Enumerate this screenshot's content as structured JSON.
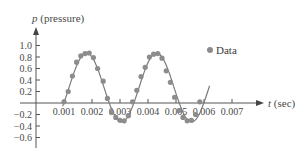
{
  "chart_data": {
    "type": "scatter",
    "title": "",
    "xlabel": "t (sec)",
    "xlabel_var": "t",
    "xlabel_unit": " (sec)",
    "ylabel": "p (pressure)",
    "ylabel_var": "p",
    "ylabel_unit": " (pressure)",
    "xlim": [
      0,
      0.0075
    ],
    "ylim": [
      -0.7,
      1.1
    ],
    "grid": false,
    "legend_position": "upper right",
    "x_ticks": [
      0.001,
      0.002,
      0.003,
      0.004,
      0.005,
      0.006,
      0.007
    ],
    "x_tick_labels": [
      "0.001",
      "0.002",
      "0.003",
      "0.004",
      "0.005",
      "0.006",
      "0.007"
    ],
    "y_ticks": [
      1.0,
      0.8,
      0.6,
      0.4,
      0.2,
      -0.2,
      -0.4,
      -0.6
    ],
    "y_tick_labels": [
      "1.0",
      "0.8",
      "0.6",
      "0.4",
      "0.2",
      "−0.2",
      "−0.4",
      "−0.6"
    ],
    "series": [
      {
        "name": "Data",
        "kind": "scatter",
        "color": "#8c8c8c",
        "points": [
          [
            0.001,
            0.02
          ],
          [
            0.00115,
            0.2
          ],
          [
            0.0013,
            0.47
          ],
          [
            0.00145,
            0.71
          ],
          [
            0.0016,
            0.82
          ],
          [
            0.00175,
            0.86
          ],
          [
            0.0019,
            0.87
          ],
          [
            0.00205,
            0.79
          ],
          [
            0.0022,
            0.6
          ],
          [
            0.0024,
            0.38
          ],
          [
            0.00255,
            0.08
          ],
          [
            0.0027,
            -0.16
          ],
          [
            0.00285,
            -0.25
          ],
          [
            0.003,
            -0.3
          ],
          [
            0.00315,
            -0.31
          ],
          [
            0.0033,
            -0.22
          ],
          [
            0.00345,
            0.02
          ],
          [
            0.0036,
            0.22
          ],
          [
            0.00375,
            0.46
          ],
          [
            0.0039,
            0.62
          ],
          [
            0.00405,
            0.8
          ],
          [
            0.0042,
            0.85
          ],
          [
            0.00435,
            0.86
          ],
          [
            0.0045,
            0.78
          ],
          [
            0.00465,
            0.56
          ],
          [
            0.0048,
            0.36
          ],
          [
            0.00495,
            0.1
          ],
          [
            0.0051,
            -0.13
          ],
          [
            0.00525,
            -0.25
          ],
          [
            0.0054,
            -0.31
          ],
          [
            0.00555,
            -0.3
          ],
          [
            0.0057,
            -0.2
          ],
          [
            0.00585,
            0.02
          ]
        ]
      },
      {
        "name": "Model fit",
        "kind": "line",
        "color": "#7a7a7a",
        "formula": "p = 0.27 + 0.60 sin(2π (t − 0.00118) / 0.0025)",
        "t_range": [
          0.00095,
          0.0062
        ]
      }
    ],
    "legend": [
      {
        "label": "Data",
        "marker": "circle",
        "color": "#8c8c8c"
      }
    ]
  },
  "labels": {
    "y_var": "p",
    "y_unit": " (pressure)",
    "x_var": "t",
    "x_unit": " (sec)",
    "legend_data": "Data"
  }
}
